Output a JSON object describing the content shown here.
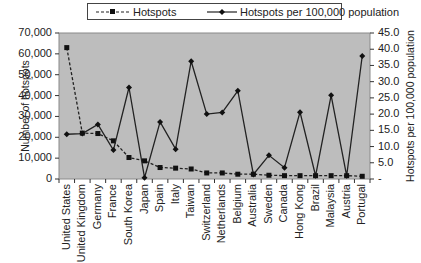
{
  "chart_data": {
    "type": "line",
    "title": "",
    "legend": {
      "position": "top",
      "entries": [
        "Hotspots",
        "Hotspots per 100,000 population"
      ]
    },
    "xlabel": "",
    "ylabel": "Number of hotspots",
    "y2label": "Hotspots per 100,000 population",
    "categories": [
      "United States",
      "United Kingdom",
      "Germany",
      "France",
      "South Korea",
      "Japan",
      "Spain",
      "Italy",
      "Taiwan",
      "Switzerland",
      "Netherlands",
      "Belgium",
      "Australia",
      "Sweden",
      "Canada",
      "Hong Kong",
      "Brazil",
      "Malaysia",
      "Austria",
      "Portugal"
    ],
    "series": [
      {
        "name": "Hotspots",
        "axis": "left",
        "style": "dashed",
        "marker": "square",
        "values": [
          63000,
          22000,
          21800,
          18300,
          10300,
          8700,
          5500,
          5200,
          4800,
          2900,
          2900,
          2300,
          2300,
          1800,
          1600,
          1600,
          1600,
          1600,
          1600,
          1300
        ]
      },
      {
        "name": "Hotspots per 100,000 population",
        "axis": "right",
        "style": "solid",
        "marker": "diamond",
        "values": [
          13.8,
          14.0,
          16.8,
          8.9,
          28.2,
          0.4,
          17.6,
          9.2,
          36.3,
          20.0,
          20.5,
          27.2,
          1.4,
          7.3,
          3.5,
          20.6,
          1.0,
          25.8,
          1.0,
          37.9
        ]
      }
    ],
    "ylim": [
      0,
      70000
    ],
    "y2lim": [
      0,
      45
    ],
    "yticks": [
      "70,000",
      "60,000",
      "50,000",
      "40,000",
      "30,000",
      "20,000",
      "10,000",
      "0"
    ],
    "y2ticks": [
      "45.0",
      "40.0",
      "35.0",
      "30.0",
      "25.0",
      "20.0",
      "15.0",
      "10.0",
      "5.0",
      "-"
    ],
    "grid": false,
    "plot_background": "#bdbdbd"
  },
  "legend": {
    "hotspots_label": "Hotspots",
    "per_capita_label": "Hotspots per 100,000 population"
  },
  "axes": {
    "left_title": "Number of hotspots",
    "right_title": "Hotspots per 100,000 population"
  }
}
